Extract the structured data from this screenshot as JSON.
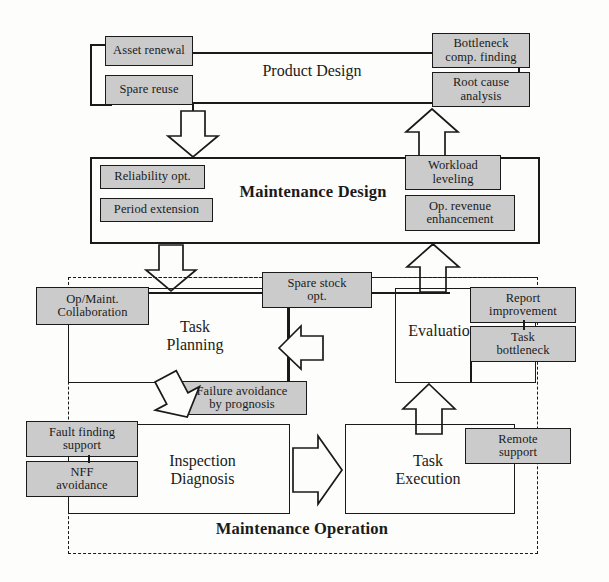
{
  "diagram": {
    "colors": {
      "chip_fill": "#cbcbcb",
      "stroke": "#1a1a1a",
      "background": "#fdfdfb"
    },
    "sections": {
      "product_design": "Product Design",
      "maintenance_design": "Maintenance Design",
      "task_planning": "Task\nPlanning",
      "task_planning_line1": "Task",
      "task_planning_line2": "Planning",
      "evaluation": "Evaluation",
      "inspection_line1": "Inspection",
      "inspection_line2": "Diagnosis",
      "execution_line1": "Task",
      "execution_line2": "Execution",
      "maintenance_operation": "Maintenance Operation"
    },
    "chips": {
      "asset_renewal": "Asset renewal",
      "spare_reuse": "Spare reuse",
      "bottleneck_comp_finding_l1": "Bottleneck",
      "bottleneck_comp_finding_l2": "comp.  finding",
      "root_cause_l1": "Root cause",
      "root_cause_l2": "analysis",
      "reliability_opt": "Reliability opt.",
      "period_extension": "Period extension",
      "workload_leveling_l1": "Workload",
      "workload_leveling_l2": "leveling",
      "op_revenue_l1": "Op. revenue",
      "op_revenue_l2": "enhancement",
      "op_maint_collab_l1": "Op/Maint.",
      "op_maint_collab_l2": "Collaboration",
      "spare_stock_opt_l1": "Spare stock",
      "spare_stock_opt_l2": "opt.",
      "report_improvement_l1": "Report",
      "report_improvement_l2": "improvement",
      "task_bottleneck_l1": "Task",
      "task_bottleneck_l2": "bottleneck",
      "failure_avoidance_l1": "Failure avoidance",
      "failure_avoidance_l2": "by prognosis",
      "fault_finding_l1": "Fault finding",
      "fault_finding_l2": "support",
      "nff_avoidance_l1": "NFF",
      "nff_avoidance_l2": "avoidance",
      "remote_support_l1": "Remote",
      "remote_support_l2": "support"
    }
  }
}
